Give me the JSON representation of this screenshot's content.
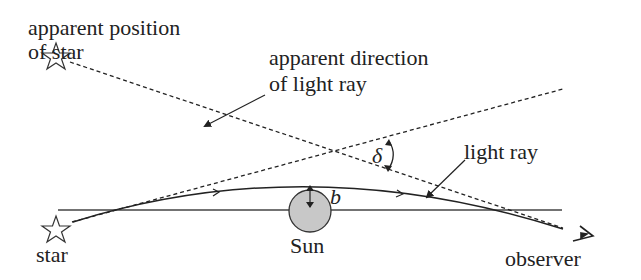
{
  "labels": {
    "apparent_position_line1": "apparent position",
    "apparent_position_line2": "of star",
    "apparent_direction_line1": "apparent direction",
    "apparent_direction_line2": "of light ray",
    "light_ray": "light ray",
    "delta": "δ",
    "b": "b",
    "sun": "Sun",
    "star": "star",
    "observer": "observer"
  },
  "colors": {
    "line": "#222222",
    "sun_fill": "#c8c8c8"
  }
}
